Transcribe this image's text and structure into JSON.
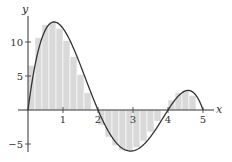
{
  "chart_data": {
    "type": "bar",
    "subtype": "riemann-sum-with-curve",
    "title": "",
    "xlabel": "x",
    "ylabel": "y",
    "xlim": [
      0,
      5.5
    ],
    "ylim": [
      -6.5,
      14.5
    ],
    "grid": false,
    "legend": null,
    "x_ticks": [
      1,
      2,
      3,
      4,
      5
    ],
    "x_tick_labels": [
      "1",
      "2",
      "3",
      "4",
      "5"
    ],
    "y_ticks": [
      10,
      5,
      -5
    ],
    "y_tick_labels": [
      "10",
      "5",
      "−5"
    ],
    "curve": {
      "name": "f(x) = -x(x-2)(x-4)(x-5)",
      "domain": [
        0,
        5
      ],
      "color": "#333333"
    },
    "bar_width": 0.2,
    "bar_color": "#d9d9d9",
    "bar_edge_color": "#ffffff",
    "categories": [
      0.2,
      0.4,
      0.6,
      0.8,
      1.0,
      1.2,
      1.4,
      1.6,
      1.8,
      2.0,
      2.2,
      2.4,
      2.6,
      2.8,
      3.0,
      3.2,
      3.4,
      3.6,
      3.8,
      4.0,
      4.2,
      4.4,
      4.6,
      4.8,
      5.0
    ],
    "values": [
      6.57,
      10.6,
      12.57,
      12.9,
      12.0,
      10.21,
      7.86,
      5.22,
      2.53,
      0.0,
      -2.22,
      -3.99,
      -5.24,
      -5.91,
      -6.0,
      -5.53,
      -4.57,
      -3.23,
      -1.64,
      0.0,
      1.48,
      2.53,
      2.87,
      2.15,
      0.0
    ]
  },
  "axes": {
    "x_label": "x",
    "y_label": "y",
    "x_tick_labels": [
      "1",
      "2",
      "3",
      "4",
      "5"
    ],
    "y_tick_labels": [
      "10",
      "5",
      "−5"
    ]
  }
}
